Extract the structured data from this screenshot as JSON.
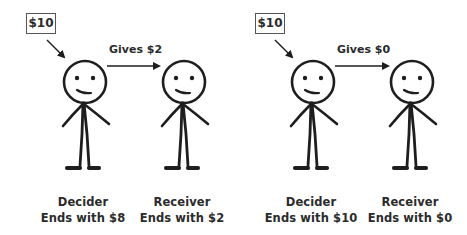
{
  "panels": [
    {
      "start_amount": "$10",
      "transfer_label": "Gives $2",
      "decider": {
        "role": "Decider",
        "outcome": "Ends with $8"
      },
      "receiver": {
        "role": "Receiver",
        "outcome": "Ends with $2"
      }
    },
    {
      "start_amount": "$10",
      "transfer_label": "Gives $0",
      "decider": {
        "role": "Decider",
        "outcome": "Ends with $10"
      },
      "receiver": {
        "role": "Receiver",
        "outcome": "Ends with $0"
      }
    }
  ],
  "colors": {
    "ink": "#1e1e1e",
    "text": "#2b2b2b",
    "box_border": "#555555"
  }
}
